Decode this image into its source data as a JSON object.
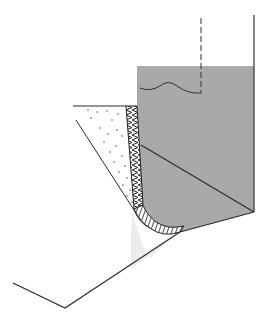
{
  "diagram": {
    "title": "",
    "type": "cross-section",
    "labels": [],
    "colors": {
      "background": "#ffffff",
      "block_fill": "#a9a9a9",
      "light_fill": "#ececec",
      "stroke": "#2a2a2a",
      "dots": "#555555"
    },
    "regions": [
      {
        "name": "gray-block",
        "description": "shaded solid block"
      },
      {
        "name": "dotted-fill",
        "description": "stippled triangular fill"
      },
      {
        "name": "hatched-strip",
        "description": "cross-hatched strip along block edge and bottom corner"
      },
      {
        "name": "light-wedge",
        "description": "light gray wedge below corner"
      }
    ],
    "lines": [
      {
        "name": "dashed-vertical-line"
      },
      {
        "name": "wavy-line"
      },
      {
        "name": "right-wall-line"
      },
      {
        "name": "inner-diagonal-line"
      },
      {
        "name": "bottom-outline"
      }
    ]
  }
}
